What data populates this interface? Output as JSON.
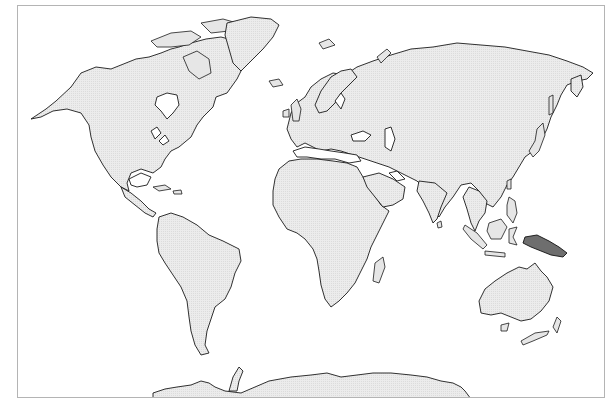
{
  "map": {
    "type": "world-outline-map",
    "projection": "Robinson-like (no graticule)",
    "frame": {
      "x": 17,
      "y": 5,
      "width": 588,
      "height": 393,
      "border_color": "#b4b4b4"
    },
    "colors": {
      "background": "#ffffff",
      "land_fill": "#e8e8e8",
      "coastline": "#1a1a1a",
      "highlight_fill": "#6e6e6e"
    },
    "highlighted_regions": [
      {
        "name": "New Guinea",
        "fill": "#6e6e6e"
      }
    ],
    "continents": [
      "North America",
      "Greenland",
      "South America",
      "Europe",
      "Africa",
      "Asia",
      "Australia",
      "New Zealand",
      "Antarctica"
    ],
    "labels": []
  }
}
